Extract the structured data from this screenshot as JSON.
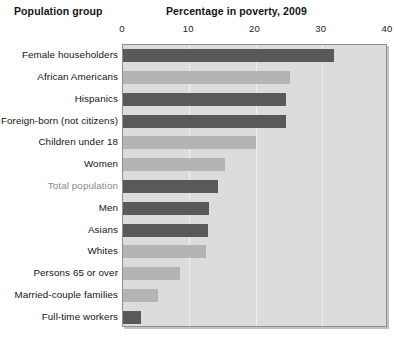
{
  "header": {
    "left_title": "Population group",
    "right_title": "Percentage in poverty, 2009"
  },
  "chart_data": {
    "type": "bar",
    "orientation": "horizontal",
    "title": "Percentage in poverty, 2009",
    "xlabel": "Percentage in poverty, 2009",
    "ylabel": "Population group",
    "xlim": [
      0,
      40
    ],
    "ticks": [
      0,
      10,
      20,
      30,
      40
    ],
    "tick_labels": [
      "0",
      "10",
      "20",
      "30",
      "40"
    ],
    "grid": true,
    "gridlines_at": [
      10,
      20,
      30
    ],
    "legend": "none",
    "plot_background": "#dcdcdc",
    "colors": {
      "dark_bar": "#595959",
      "light_bar": "#b4b4b4",
      "plot_bg": "#dcdcdc",
      "plot_border": "#8f8f8f",
      "label_default": "#141414",
      "label_highlight": "#8a8a8a"
    },
    "categories": [
      "Female householders",
      "African Americans",
      "Hispanics",
      "Foreign-born (not citizens)",
      "Children under 18",
      "Women",
      "Total population",
      "Men",
      "Asians",
      "Whites",
      "Persons 65 or over",
      "Married-couple families",
      "Full-time workers"
    ],
    "values": [
      31.8,
      25.2,
      24.6,
      24.6,
      20.1,
      15.4,
      14.3,
      13.0,
      12.8,
      12.6,
      8.6,
      5.3,
      2.7
    ],
    "bar_styles": [
      "dark",
      "light",
      "dark",
      "dark",
      "light",
      "light",
      "dark",
      "dark",
      "dark",
      "light",
      "light",
      "light",
      "dark"
    ],
    "label_styles": [
      "normal",
      "normal",
      "normal",
      "normal",
      "normal",
      "normal",
      "highlight",
      "normal",
      "normal",
      "normal",
      "normal",
      "normal",
      "normal"
    ]
  }
}
